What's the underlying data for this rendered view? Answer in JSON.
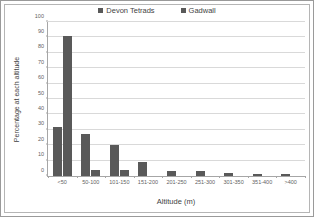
{
  "chart_data": {
    "type": "bar",
    "title": "",
    "xlabel": "Altitude (m)",
    "ylabel": "Percentage at each altitude",
    "categories": [
      "<50",
      "50-100",
      "101-150",
      "151-200",
      "201-250",
      "251-300",
      "301-350",
      "351-400",
      ">400"
    ],
    "series": [
      {
        "name": "Devon Tetrads",
        "color": "#595959",
        "values": [
          32,
          27,
          20,
          9,
          3,
          3,
          2,
          1,
          1
        ]
      },
      {
        "name": "Gadwall",
        "color": "#595959",
        "values": [
          91,
          4,
          4,
          0,
          0,
          0,
          0,
          0,
          0
        ]
      }
    ],
    "ylim": [
      0,
      100
    ],
    "ytick_step": 10,
    "yticks": [
      "0",
      "10",
      "20",
      "30",
      "40",
      "50",
      "60",
      "70",
      "80",
      "90",
      "100"
    ],
    "grid": true,
    "legend_position": "top-center"
  },
  "legend": {
    "items": [
      {
        "label": "Devon Tetrads",
        "color": "#595959"
      },
      {
        "label": "Gadwall",
        "color": "#595959"
      }
    ]
  },
  "axes": {
    "x_title": "Altitude (m)",
    "y_title": "Percentage at each altitude"
  }
}
